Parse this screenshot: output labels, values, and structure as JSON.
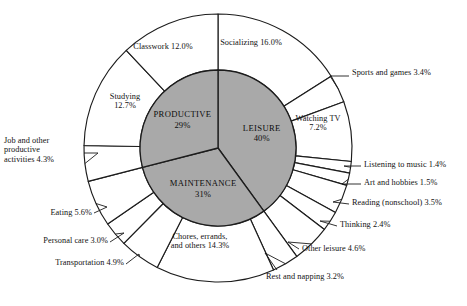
{
  "chart_data": {
    "type": "pie",
    "title": "",
    "subtitle": "",
    "xlabel": "",
    "ylabel": "",
    "grid": false,
    "legend_position": "none",
    "layout": {
      "center_x": 218,
      "center_y": 148,
      "inner_radius": 78,
      "outer_radius": 134,
      "start_angle_deg": -90,
      "direction": "clockwise",
      "inner_fill": "#a9a9a9",
      "outer_fill": "#ffffff",
      "stroke": "#1c1c1c"
    },
    "inner_ring": {
      "name": "Major time-use category",
      "categories": [
        "LEISURE",
        "MAINTENANCE",
        "PRODUCTIVE"
      ],
      "values": [
        40,
        31,
        29
      ],
      "value_labels": [
        "40%",
        "31%",
        "29%"
      ]
    },
    "outer_ring": {
      "name": "Detailed activity",
      "categories": [
        "Socializing",
        "Sports and games",
        "Watching TV",
        "Listening to music",
        "Art and hobbies",
        "Reading (nonschool)",
        "Thinking",
        "Other leisure",
        "Rest and napping",
        "Chores, errands, and others",
        "Transportation",
        "Personal care",
        "Eating",
        "Job and other productive activities",
        "Studying",
        "Classwork"
      ],
      "values": [
        16.0,
        3.4,
        7.2,
        1.4,
        1.5,
        3.5,
        2.4,
        4.6,
        3.2,
        14.3,
        4.9,
        3.0,
        5.6,
        4.3,
        12.7,
        12.0
      ],
      "value_labels": [
        "16.0%",
        "3.4%",
        "7.2%",
        "1.4%",
        "1.5%",
        "3.5%",
        "2.4%",
        "4.6%",
        "3.2%",
        "14.3%",
        "4.9%",
        "3.0%",
        "5.6%",
        "4.3%",
        "12.7%",
        "12.0%"
      ],
      "parents": [
        "LEISURE",
        "LEISURE",
        "LEISURE",
        "LEISURE",
        "LEISURE",
        "LEISURE",
        "LEISURE",
        "LEISURE",
        "MAINTENANCE",
        "MAINTENANCE",
        "MAINTENANCE",
        "MAINTENANCE",
        "MAINTENANCE",
        "PRODUCTIVE",
        "PRODUCTIVE",
        "PRODUCTIVE"
      ]
    }
  },
  "inner_labels": [
    {
      "name": "LEISURE",
      "pct": "40%"
    },
    {
      "name": "MAINTENANCE",
      "pct": "31%"
    },
    {
      "name": "PRODUCTIVE",
      "pct": "29%"
    }
  ],
  "outer_labels": [
    {
      "text": "Socializing 16.0%"
    },
    {
      "text": "Sports and games 3.4%"
    },
    {
      "text": "Watching TV\n7.2%"
    },
    {
      "text": "Listening to music 1.4%"
    },
    {
      "text": "Art and hobbies 1.5%"
    },
    {
      "text": "Reading (nonschool) 3.5%"
    },
    {
      "text": "Thinking 2.4%"
    },
    {
      "text": "Other leisure 4.6%"
    },
    {
      "text": "Rest and napping 3.2%"
    },
    {
      "text": "Chores, errands,\nand others 14.3%"
    },
    {
      "text": "Transportation 4.9%"
    },
    {
      "text": "Personal care 3.0%"
    },
    {
      "text": "Eating 5.6%"
    },
    {
      "text": "Job and other\nproductive\nactivities 4.3%"
    },
    {
      "text": "Studying\n12.7%"
    },
    {
      "text": "Classwork 12.0%"
    }
  ]
}
